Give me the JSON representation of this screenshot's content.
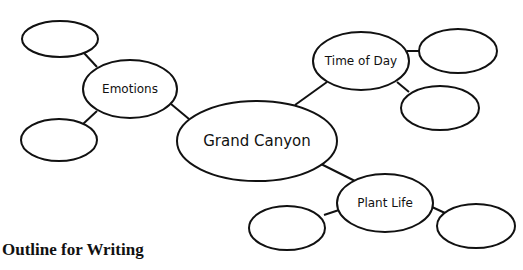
{
  "diagram": {
    "type": "web-organizer",
    "stroke_color": "#111111",
    "background": "#ffffff",
    "center": {
      "id": "grand-canyon",
      "label": "Grand Canyon",
      "cx": 257,
      "cy": 141,
      "rx": 80,
      "ry": 40,
      "font_size": 15
    },
    "subtopics": [
      {
        "id": "emotions",
        "label": "Emotions",
        "cx": 130,
        "cy": 89,
        "rx": 47,
        "ry": 29,
        "font_size": 12
      },
      {
        "id": "time-of-day",
        "label": "Time of Day",
        "cx": 361,
        "cy": 61,
        "rx": 48,
        "ry": 29,
        "font_size": 12
      },
      {
        "id": "plant-life",
        "label": "Plant Life",
        "cx": 385,
        "cy": 203,
        "rx": 48,
        "ry": 29,
        "font_size": 12
      }
    ],
    "detail_bubbles": [
      {
        "id": "emotions-detail-1",
        "parent": "emotions",
        "label": "",
        "cx": 60,
        "cy": 39,
        "rx": 38,
        "ry": 18
      },
      {
        "id": "emotions-detail-2",
        "parent": "emotions",
        "label": "",
        "cx": 59,
        "cy": 140,
        "rx": 38,
        "ry": 21
      },
      {
        "id": "time-detail-1",
        "parent": "time-of-day",
        "label": "",
        "cx": 458,
        "cy": 51,
        "rx": 39,
        "ry": 22
      },
      {
        "id": "time-detail-2",
        "parent": "time-of-day",
        "label": "",
        "cx": 440,
        "cy": 108,
        "rx": 39,
        "ry": 22
      },
      {
        "id": "plant-detail-1",
        "parent": "plant-life",
        "label": "",
        "cx": 287,
        "cy": 228,
        "rx": 38,
        "ry": 22
      },
      {
        "id": "plant-detail-2",
        "parent": "plant-life",
        "label": "",
        "cx": 476,
        "cy": 226,
        "rx": 39,
        "ry": 22
      }
    ],
    "connectors": [
      {
        "from": "emotions-detail-1",
        "to": "emotions",
        "x1": 84,
        "y1": 53,
        "x2": 97,
        "y2": 67
      },
      {
        "from": "emotions-detail-2",
        "to": "emotions",
        "x1": 83,
        "y1": 124,
        "x2": 97,
        "y2": 111
      },
      {
        "from": "emotions",
        "to": "grand-canyon",
        "x1": 171,
        "y1": 104,
        "x2": 189,
        "y2": 119
      },
      {
        "from": "grand-canyon",
        "to": "time-of-day",
        "x1": 295,
        "y1": 105,
        "x2": 327,
        "y2": 82
      },
      {
        "from": "time-of-day",
        "to": "time-detail-1",
        "x1": 407,
        "y1": 51,
        "x2": 419,
        "y2": 51
      },
      {
        "from": "time-of-day",
        "to": "time-detail-2",
        "x1": 397,
        "y1": 82,
        "x2": 409,
        "y2": 92
      },
      {
        "from": "grand-canyon",
        "to": "plant-life",
        "x1": 321,
        "y1": 164,
        "x2": 355,
        "y2": 181
      },
      {
        "from": "plant-life",
        "to": "plant-detail-1",
        "x1": 324,
        "y1": 215,
        "x2": 339,
        "y2": 210
      },
      {
        "from": "plant-life",
        "to": "plant-detail-2",
        "x1": 432,
        "y1": 207,
        "x2": 445,
        "y2": 213
      }
    ]
  },
  "heading": {
    "outline_title": "Outline for Writing"
  }
}
